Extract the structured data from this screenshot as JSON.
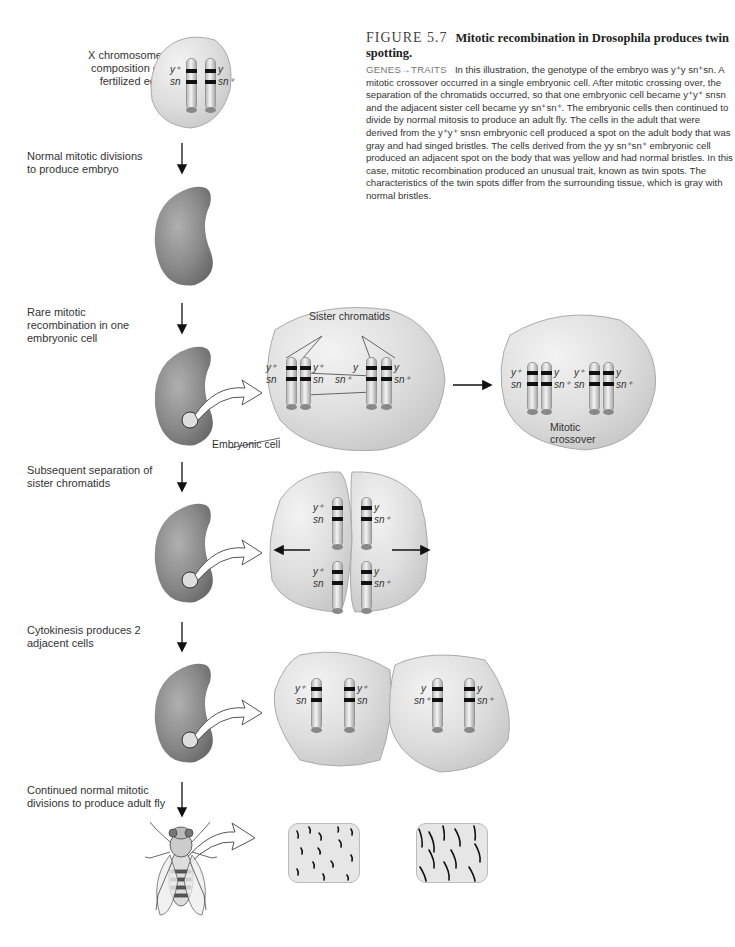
{
  "caption": {
    "figure_number": "FIGURE 5.7",
    "title": "Mitotic recombination in Drosophila produces twin spotting.",
    "tag": "GENES→TRAITS",
    "body": "In this illustration, the genotype of the embryo was y⁺y sn⁺sn. A mitotic crossover occurred in a single embryonic cell. After mitotic crossing over, the separation of the chromatids occurred, so that one embryonic cell became y⁺y⁺ snsn and the adjacent sister cell became yy sn⁺sn⁺. The embryonic cells then continued to divide by normal mitosis to produce an adult fly. The cells in the adult that were derived from the y⁺y⁺ snsn embryonic cell produced a spot on the adult body that was gray and had singed bristles. The cells derived from the yy sn⁺sn⁺ embryonic cell produced an adjacent spot on the body that was yellow and had normal bristles. In this case, mitotic recombination produced an unusual trait, known as twin spots. The characteristics of the twin spots differ from the surrounding tissue, which is gray with normal bristles."
  },
  "steps": [
    {
      "label": "X chromosome composition of fertilized egg"
    },
    {
      "label": "Normal mitotic divisions to produce embryo"
    },
    {
      "label": "Rare mitotic recombination in one embryonic cell"
    },
    {
      "label": "Subsequent separation of sister chromatids"
    },
    {
      "label": "Cytokinesis produces 2 adjacent cells"
    },
    {
      "label": "Continued normal mitotic divisions to produce adult fly"
    }
  ],
  "annotations": {
    "sister_chromatids": "Sister chromatids",
    "embryonic_cell": "Embryonic cell",
    "mitotic_crossover": "Mitotic crossover"
  },
  "genes": {
    "y_plus": "y⁺",
    "y": "y",
    "sn": "sn",
    "sn_plus": "sn⁺"
  },
  "colors": {
    "cell_fill": "#dcdcdc",
    "embryo_fill": "#8a8a8a",
    "band": "#111111"
  }
}
